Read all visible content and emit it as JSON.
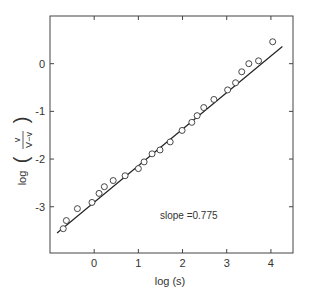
{
  "chart_data": {
    "type": "scatter",
    "title": "",
    "xlabel": "log (s)",
    "ylabel": "log ( v / (V−v) )",
    "ylabel_parts": {
      "prefix": "log",
      "numerator": "v",
      "denominator": "V−v"
    },
    "xlim": [
      -1.0,
      4.5
    ],
    "ylim": [
      -3.97,
      1.0
    ],
    "xticks": [
      0,
      1,
      2,
      3,
      4
    ],
    "xtick_labels": [
      "0",
      "1",
      "2",
      "3",
      "4"
    ],
    "yticks": [
      0,
      -1,
      -2,
      -3
    ],
    "ytick_labels": [
      "0",
      "-1",
      "-2",
      "-3"
    ],
    "grid": false,
    "legend": null,
    "annotation": "slope =0.775",
    "series": [
      {
        "name": "data",
        "marker": "open-circle",
        "points": [
          {
            "x": -0.7,
            "y": -3.46
          },
          {
            "x": -0.63,
            "y": -3.29
          },
          {
            "x": -0.38,
            "y": -3.04
          },
          {
            "x": -0.05,
            "y": -2.91
          },
          {
            "x": 0.11,
            "y": -2.72
          },
          {
            "x": 0.23,
            "y": -2.58
          },
          {
            "x": 0.43,
            "y": -2.45
          },
          {
            "x": 0.7,
            "y": -2.35
          },
          {
            "x": 1.0,
            "y": -2.2
          },
          {
            "x": 1.13,
            "y": -2.06
          },
          {
            "x": 1.31,
            "y": -1.89
          },
          {
            "x": 1.49,
            "y": -1.81
          },
          {
            "x": 1.72,
            "y": -1.64
          },
          {
            "x": 1.99,
            "y": -1.4
          },
          {
            "x": 2.21,
            "y": -1.23
          },
          {
            "x": 2.33,
            "y": -1.09
          },
          {
            "x": 2.48,
            "y": -0.92
          },
          {
            "x": 2.71,
            "y": -0.75
          },
          {
            "x": 3.02,
            "y": -0.55
          },
          {
            "x": 3.2,
            "y": -0.4
          },
          {
            "x": 3.34,
            "y": -0.17
          },
          {
            "x": 3.5,
            "y": 0.0
          },
          {
            "x": 3.72,
            "y": 0.06
          },
          {
            "x": 4.04,
            "y": 0.46
          }
        ]
      },
      {
        "name": "fit",
        "type": "line",
        "slope": 0.775,
        "points": [
          {
            "x": -0.84,
            "y": -3.55
          },
          {
            "x": 4.26,
            "y": 0.36
          }
        ]
      }
    ]
  }
}
